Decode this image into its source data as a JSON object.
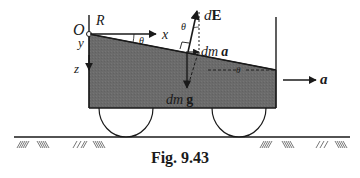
{
  "figure": {
    "caption": "Fig. 9.43",
    "labels": {
      "origin": "O",
      "R": "R",
      "x_axis": "x",
      "y_axis": "y",
      "z_axis": "z",
      "theta_top": "θ",
      "theta_vec": "θ",
      "theta_right": "θ",
      "dE_d": "d",
      "dE_E": "E",
      "dma_dm": "dm",
      "dma_a": "a",
      "dmg_dm": "dm",
      "dmg_g": "g",
      "accel": "a"
    },
    "colors": {
      "liquid": "#6b6b6b",
      "line": "#1a1a1a",
      "background": "#ffffff"
    },
    "elements": [
      "container-with-liquid",
      "inclined-liquid-surface",
      "two-wheels",
      "hatched-ground",
      "force-vectors: dE, dm a, dm g",
      "acceleration-arrow a"
    ]
  }
}
